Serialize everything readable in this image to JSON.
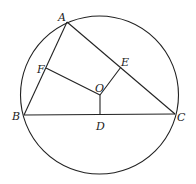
{
  "diagram": {
    "type": "geometry",
    "circle": {
      "cx": 99.5,
      "cy": 95,
      "r": 79
    },
    "points": {
      "A": {
        "x": 67,
        "y": 22
      },
      "B": {
        "x": 24,
        "y": 115
      },
      "C": {
        "x": 175,
        "y": 114
      },
      "D": {
        "x": 100,
        "y": 115
      },
      "O": {
        "x": 100,
        "y": 95
      },
      "E": {
        "x": 121,
        "y": 67
      },
      "F": {
        "x": 46,
        "y": 68
      }
    },
    "labels": {
      "A": "A",
      "B": "B",
      "C": "C",
      "D": "D",
      "E": "E",
      "F": "F",
      "O": "O"
    },
    "segments": [
      [
        "A",
        "B"
      ],
      [
        "B",
        "C"
      ],
      [
        "C",
        "A"
      ],
      [
        "O",
        "D"
      ],
      [
        "O",
        "E"
      ],
      [
        "O",
        "F"
      ]
    ],
    "stroke_color": "#222222"
  }
}
